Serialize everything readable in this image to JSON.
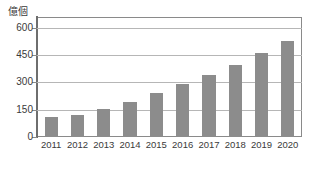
{
  "chart_data": {
    "type": "bar",
    "title": "",
    "subtitle": "",
    "unit_label": "億個",
    "xlabel": "",
    "ylabel": "億個",
    "categories": [
      "2011",
      "2012",
      "2013",
      "2014",
      "2015",
      "2016",
      "2017",
      "2018",
      "2019",
      "2020"
    ],
    "values": [
      108,
      122,
      155,
      192,
      240,
      293,
      343,
      398,
      460,
      527
    ],
    "series": [
      {
        "name": "",
        "values": [
          108,
          122,
          155,
          192,
          240,
          293,
          343,
          398,
          460,
          527
        ]
      }
    ],
    "ylim": [
      0,
      660
    ],
    "y_ticks": [
      0,
      150,
      300,
      450,
      600
    ],
    "y_tick_labels": [
      "0",
      "150",
      "300",
      "450",
      "600"
    ],
    "x_tick_labels": [
      "2011",
      "2012",
      "2013",
      "2014",
      "2015",
      "2016",
      "2017",
      "2018",
      "2019",
      "2020"
    ],
    "grid": true,
    "grid_axis": "y",
    "legend": false,
    "legend_position": "none",
    "bar_color": "#8c8c8c",
    "grid_color": "#b6b6b6",
    "axis_color": "#6e6e6e",
    "frame_color": "#8a8a8a",
    "text_color": "#3a3a3a",
    "background": "#ffffff",
    "annotations": []
  }
}
